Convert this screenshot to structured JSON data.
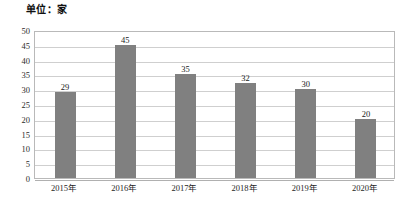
{
  "chart_data": {
    "type": "bar",
    "title": "单位：家",
    "xlabel": "",
    "ylabel": "",
    "categories": [
      "2015年",
      "2016年",
      "2017年",
      "2018年",
      "2019年",
      "2020年"
    ],
    "values": [
      29,
      45,
      35,
      32,
      30,
      20
    ],
    "ylim": [
      0,
      50
    ],
    "ytick_step": 5,
    "yticks": [
      "50",
      "45",
      "40",
      "35",
      "30",
      "25",
      "20",
      "15",
      "10",
      "5",
      "0"
    ],
    "grid": true,
    "legend": "none",
    "bar_color": "#808080",
    "grid_color": "#cfcfcf",
    "border_color": "#b9b9b9",
    "background": "#ffffff",
    "data_labels": [
      "29",
      "45",
      "35",
      "32",
      "30",
      "20"
    ]
  }
}
